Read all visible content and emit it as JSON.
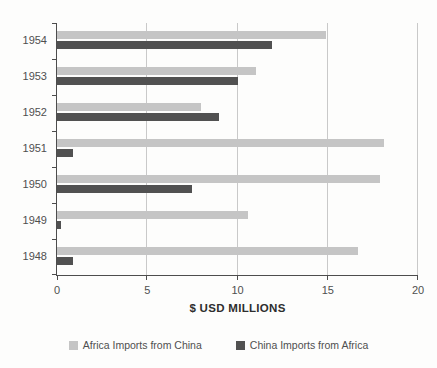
{
  "chart_data": {
    "type": "bar",
    "orientation": "horizontal",
    "title": "",
    "xlabel": "$ USD MILLIONS",
    "ylabel": "",
    "xlim": [
      0,
      20
    ],
    "xticks": [
      0,
      5,
      10,
      15,
      20
    ],
    "gridlines": "vertical",
    "legend_position": "bottom",
    "categories": [
      "1954",
      "1953",
      "1952",
      "1951",
      "1950",
      "1949",
      "1948"
    ],
    "series": [
      {
        "name": "Africa Imports from China",
        "color": "#c5c5c5",
        "values": [
          14.9,
          11.0,
          8.0,
          18.1,
          17.9,
          10.6,
          16.7
        ]
      },
      {
        "name": "China Imports from Africa",
        "color": "#515151",
        "values": [
          11.9,
          10.0,
          9.0,
          0.9,
          7.5,
          0.2,
          0.9
        ]
      }
    ]
  },
  "colors": {
    "background": "#fdfdfc",
    "axis_line": "#4d4d4d",
    "gridline": "#c9c9c9",
    "tick_label": "#4f4f4f",
    "axis_title": "#2e2e2e"
  }
}
